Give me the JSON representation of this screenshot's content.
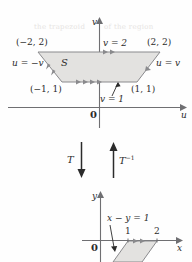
{
  "figure": {
    "title_none": "",
    "upper_plane": {
      "axis_v_label": "v",
      "axis_u_label": "u",
      "origin_label": "0",
      "region_label": "S",
      "vertex_top_left": "(−2, 2)",
      "vertex_top_right": "(2, 2)",
      "vertex_bottom_left": "(−1, 1)",
      "vertex_bottom_right": "(1, 1)",
      "edge_top_label": "v = 2",
      "edge_bottom_label": "v = 1",
      "edge_left_label": "u = −v",
      "edge_right_label": "u = v"
    },
    "transform": {
      "forward_label": "T",
      "inverse_label": "T−1",
      "inverse_base": "T",
      "inverse_exp": "−1"
    },
    "lower_plane": {
      "axis_y_label": "y",
      "axis_x_label": "x",
      "origin_label": "0",
      "tick_1": "1",
      "tick_2": "2",
      "line_label": "x − y = 1"
    },
    "colors": {
      "ink": "#2b2b2b",
      "axis": "#6f6f72",
      "shape_stroke": "#8a8a8d",
      "shape_fill": "#e3e2e0",
      "ghost": "#e6e4e2"
    },
    "showthrough_text": [
      "S",
      "the trapezoid",
      "of the region"
    ]
  }
}
